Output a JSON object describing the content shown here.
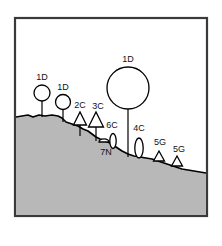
{
  "figure": {
    "name": "hillside-cross-section",
    "frame": {
      "x": 15,
      "y": 18,
      "width": 192,
      "height": 198,
      "stroke": "#3a3a3a",
      "stroke_width": 2.2
    },
    "background_color": "#ffffff",
    "ground_fill_color": "#b8b8b8",
    "ground_stroke_color": "#000000",
    "symbol_stroke_color": "#000000",
    "symbol_fill_color": "#ffffff",
    "label_color": "#111111",
    "ground_profile": "M 16,117 L 22,116 L 28,115 L 33,117 L 39,115 L 45,116 L 52,115 L 58,116 L 62,118 L 66,122 L 72,124 L 78,126 L 83,129 L 88,131 L 92,134 L 96,137 L 100,139 L 105,141 L 110,143 L 116,147 L 122,151 L 128,154 L 134,156 L 140,157 L 146,158 L 152,159 L 158,161 L 164,163 L 170,165 L 176,167 L 182,169 L 188,170 L 194,171 L 200,172 L 206,173"
  },
  "symbols": [
    {
      "id": "sym-1d-left",
      "label": "1D",
      "shape": "circle-on-stem",
      "cx": 42,
      "cy": 93,
      "r": 8,
      "stem_x": 42,
      "stem_y1": 101,
      "stem_y2": 117,
      "label_x": 42,
      "label_y": 80
    },
    {
      "id": "sym-1d-mid",
      "label": "1D",
      "shape": "circle-on-stem",
      "cx": 63,
      "cy": 102,
      "r": 7.5,
      "stem_x": 63,
      "stem_y1": 109.5,
      "stem_y2": 122,
      "label_x": 63,
      "label_y": 90
    },
    {
      "id": "sym-2c",
      "label": "2C",
      "shape": "triangle-on-stem",
      "cx": 80,
      "base_y": 125,
      "half_width": 6.5,
      "height": 13,
      "stem_x": 80,
      "stem_y1": 125,
      "stem_y2": 136,
      "label_x": 80,
      "label_y": 108
    },
    {
      "id": "sym-3c",
      "label": "3C",
      "shape": "triangle-on-stem",
      "cx": 96,
      "base_y": 127,
      "half_width": 7.5,
      "height": 15,
      "stem_x": 96,
      "stem_y1": 127,
      "stem_y2": 141,
      "label_x": 98,
      "label_y": 109
    },
    {
      "id": "sym-1d-large",
      "label": "1D",
      "shape": "circle-on-stem",
      "cx": 128,
      "cy": 88,
      "r": 21,
      "stem_x": 128,
      "stem_y1": 109,
      "stem_y2": 157,
      "label_x": 128,
      "label_y": 62
    },
    {
      "id": "sym-6c",
      "label": "6C",
      "shape": "lens",
      "cx": 113,
      "cy": 141,
      "rx": 3.2,
      "ry": 7.5,
      "label_x": 112,
      "label_y": 128
    },
    {
      "id": "sym-7n",
      "label": "7N",
      "shape": "dome",
      "cx": 104,
      "base_y": 142,
      "rx": 5,
      "ry": 3.2,
      "label_x": 106,
      "label_y": 155
    },
    {
      "id": "sym-4c",
      "label": "4C",
      "shape": "lens",
      "cx": 139,
      "cy": 148,
      "rx": 4.2,
      "ry": 10,
      "label_x": 139,
      "label_y": 131
    },
    {
      "id": "sym-5g-left",
      "label": "5G",
      "shape": "triangle-on-ground",
      "cx": 159,
      "base_y": 161,
      "half_width": 5.5,
      "height": 10,
      "label_x": 160,
      "label_y": 145
    },
    {
      "id": "sym-5g-right",
      "label": "5G",
      "shape": "triangle-on-ground",
      "cx": 177,
      "base_y": 166,
      "half_width": 5.5,
      "height": 10,
      "label_x": 179,
      "label_y": 152
    }
  ]
}
